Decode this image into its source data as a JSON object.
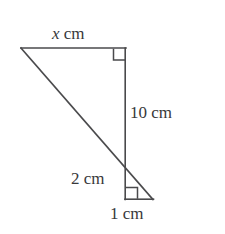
{
  "figure": {
    "background_color": "#ffffff",
    "stroke_color": "#4a4a4c",
    "text_color": "#38383a",
    "labels": {
      "x_side": {
        "variable": "x",
        "unit": "cm",
        "full": "x cm"
      },
      "vertical_side": {
        "value": "10",
        "unit": "cm",
        "full": "10 cm"
      },
      "lower_vertical_side": {
        "value": "2",
        "unit": "cm",
        "full": "2 cm"
      },
      "base_side": {
        "value": "1",
        "unit": "cm",
        "full": "1 cm"
      }
    },
    "right_angle_markers": [
      {
        "name": "top-right-angle",
        "at": "top-right vertex"
      },
      {
        "name": "bottom-left-angle",
        "at": "bottom small triangle vertex"
      }
    ],
    "vertices": {
      "left_apex": [
        21,
        48
      ],
      "top_right": [
        126,
        48
      ],
      "crossing_point": [
        125,
        170
      ],
      "bottom_left": [
        125,
        199
      ],
      "bottom_right": [
        153,
        199
      ]
    }
  }
}
